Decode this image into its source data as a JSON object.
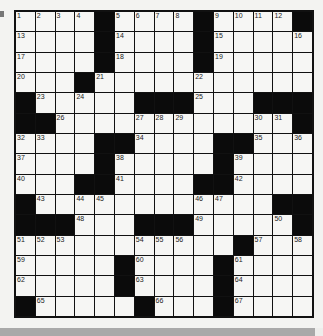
{
  "puzzle": {
    "rows": 15,
    "cols": 15,
    "grid": [
      "....#....#....#",
      "....#....#.....",
      "....#....#.....",
      "...#...........",
      "#.....###...###",
      "##............#",
      "....##....##...",
      "....#.....#....",
      "...##....##....",
      "#............##",
      "###...###.....#",
      "...........#...",
      ".....#....#....",
      ".....#....#....",
      "#.....#...#...."
    ],
    "numbers": [
      {
        "r": 0,
        "c": 0,
        "n": "1"
      },
      {
        "r": 0,
        "c": 1,
        "n": "2"
      },
      {
        "r": 0,
        "c": 2,
        "n": "3"
      },
      {
        "r": 0,
        "c": 3,
        "n": "4"
      },
      {
        "r": 0,
        "c": 5,
        "n": "5"
      },
      {
        "r": 0,
        "c": 6,
        "n": "6"
      },
      {
        "r": 0,
        "c": 7,
        "n": "7"
      },
      {
        "r": 0,
        "c": 8,
        "n": "8"
      },
      {
        "r": 0,
        "c": 10,
        "n": "9"
      },
      {
        "r": 0,
        "c": 11,
        "n": "10"
      },
      {
        "r": 0,
        "c": 12,
        "n": "11"
      },
      {
        "r": 0,
        "c": 13,
        "n": "12"
      },
      {
        "r": 1,
        "c": 0,
        "n": "13"
      },
      {
        "r": 1,
        "c": 5,
        "n": "14"
      },
      {
        "r": 1,
        "c": 10,
        "n": "15"
      },
      {
        "r": 1,
        "c": 14,
        "n": "16"
      },
      {
        "r": 2,
        "c": 0,
        "n": "17"
      },
      {
        "r": 2,
        "c": 5,
        "n": "18"
      },
      {
        "r": 2,
        "c": 10,
        "n": "19"
      },
      {
        "r": 3,
        "c": 0,
        "n": "20"
      },
      {
        "r": 3,
        "c": 4,
        "n": "21"
      },
      {
        "r": 3,
        "c": 9,
        "n": "22"
      },
      {
        "r": 4,
        "c": 1,
        "n": "23"
      },
      {
        "r": 4,
        "c": 3,
        "n": "24"
      },
      {
        "r": 4,
        "c": 9,
        "n": "25"
      },
      {
        "r": 5,
        "c": 2,
        "n": "26"
      },
      {
        "r": 5,
        "c": 6,
        "n": "27"
      },
      {
        "r": 5,
        "c": 7,
        "n": "28"
      },
      {
        "r": 5,
        "c": 8,
        "n": "29"
      },
      {
        "r": 5,
        "c": 12,
        "n": "30"
      },
      {
        "r": 5,
        "c": 13,
        "n": "31"
      },
      {
        "r": 6,
        "c": 0,
        "n": "32"
      },
      {
        "r": 6,
        "c": 1,
        "n": "33"
      },
      {
        "r": 6,
        "c": 6,
        "n": "34"
      },
      {
        "r": 6,
        "c": 12,
        "n": "35"
      },
      {
        "r": 6,
        "c": 14,
        "n": "36"
      },
      {
        "r": 7,
        "c": 0,
        "n": "37"
      },
      {
        "r": 7,
        "c": 5,
        "n": "38"
      },
      {
        "r": 7,
        "c": 11,
        "n": "39"
      },
      {
        "r": 8,
        "c": 0,
        "n": "40"
      },
      {
        "r": 8,
        "c": 5,
        "n": "41"
      },
      {
        "r": 8,
        "c": 11,
        "n": "42"
      },
      {
        "r": 9,
        "c": 1,
        "n": "43"
      },
      {
        "r": 9,
        "c": 3,
        "n": "44"
      },
      {
        "r": 9,
        "c": 4,
        "n": "45"
      },
      {
        "r": 9,
        "c": 9,
        "n": "46"
      },
      {
        "r": 9,
        "c": 10,
        "n": "47"
      },
      {
        "r": 10,
        "c": 3,
        "n": "48"
      },
      {
        "r": 10,
        "c": 9,
        "n": "49"
      },
      {
        "r": 10,
        "c": 13,
        "n": "50"
      },
      {
        "r": 11,
        "c": 0,
        "n": "51"
      },
      {
        "r": 11,
        "c": 1,
        "n": "52"
      },
      {
        "r": 11,
        "c": 2,
        "n": "53"
      },
      {
        "r": 11,
        "c": 6,
        "n": "54"
      },
      {
        "r": 11,
        "c": 7,
        "n": "55"
      },
      {
        "r": 11,
        "c": 8,
        "n": "56"
      },
      {
        "r": 11,
        "c": 12,
        "n": "57"
      },
      {
        "r": 11,
        "c": 14,
        "n": "58"
      },
      {
        "r": 12,
        "c": 0,
        "n": "59"
      },
      {
        "r": 12,
        "c": 6,
        "n": "60"
      },
      {
        "r": 12,
        "c": 11,
        "n": "61"
      },
      {
        "r": 13,
        "c": 0,
        "n": "62"
      },
      {
        "r": 13,
        "c": 6,
        "n": "63"
      },
      {
        "r": 13,
        "c": 11,
        "n": "64"
      },
      {
        "r": 14,
        "c": 1,
        "n": "65"
      },
      {
        "r": 14,
        "c": 7,
        "n": "66"
      },
      {
        "r": 14,
        "c": 11,
        "n": "67"
      }
    ]
  },
  "colors": {
    "black_square": "#0b0b0b",
    "white_square": "#f6f6f4",
    "grid_line": "#111111",
    "page": "#f3f3f1"
  }
}
